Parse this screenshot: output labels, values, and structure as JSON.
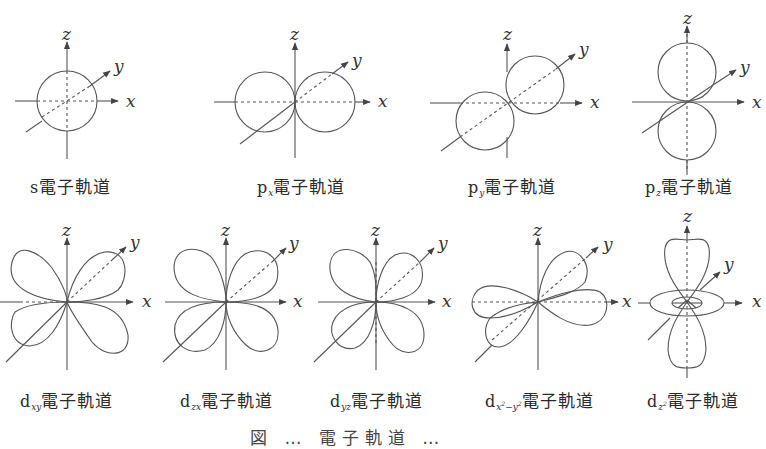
{
  "figure": {
    "type": "atomic orbital shapes",
    "axis_labels": {
      "x": "x",
      "y": "y",
      "z": "z"
    },
    "top_row": [
      {
        "id": "s",
        "prefix": "s",
        "subscript": "",
        "suffix": "電子軌道"
      },
      {
        "id": "px",
        "prefix": "p",
        "subscript": "x",
        "suffix": "電子軌道"
      },
      {
        "id": "py",
        "prefix": "p",
        "subscript": "y",
        "suffix": "電子軌道"
      },
      {
        "id": "pz",
        "prefix": "p",
        "subscript": "z",
        "suffix": "電子軌道"
      }
    ],
    "bottom_row": [
      {
        "id": "dxy",
        "prefix": "d",
        "subscript": "xy",
        "suffix": "電子軌道"
      },
      {
        "id": "dzx",
        "prefix": "d",
        "subscript": "zx",
        "suffix": "電子軌道"
      },
      {
        "id": "dyz",
        "prefix": "d",
        "subscript": "yz",
        "suffix": "電子軌道"
      },
      {
        "id": "dx2y2",
        "prefix": "d",
        "subscript": "x",
        "subscript_sup1": "2",
        "subscript_mid": "−y",
        "subscript_sup2": "2",
        "suffix": "電子軌道"
      },
      {
        "id": "dz2",
        "prefix": "d",
        "subscript": "z",
        "subscript_sup1": "2",
        "suffix": "電子軌道"
      }
    ],
    "caption_partial": "図 … 電子軌道 …"
  },
  "colors": {
    "line": "#4a4a4a",
    "text": "#2a2a2a",
    "background": "#ffffff"
  }
}
